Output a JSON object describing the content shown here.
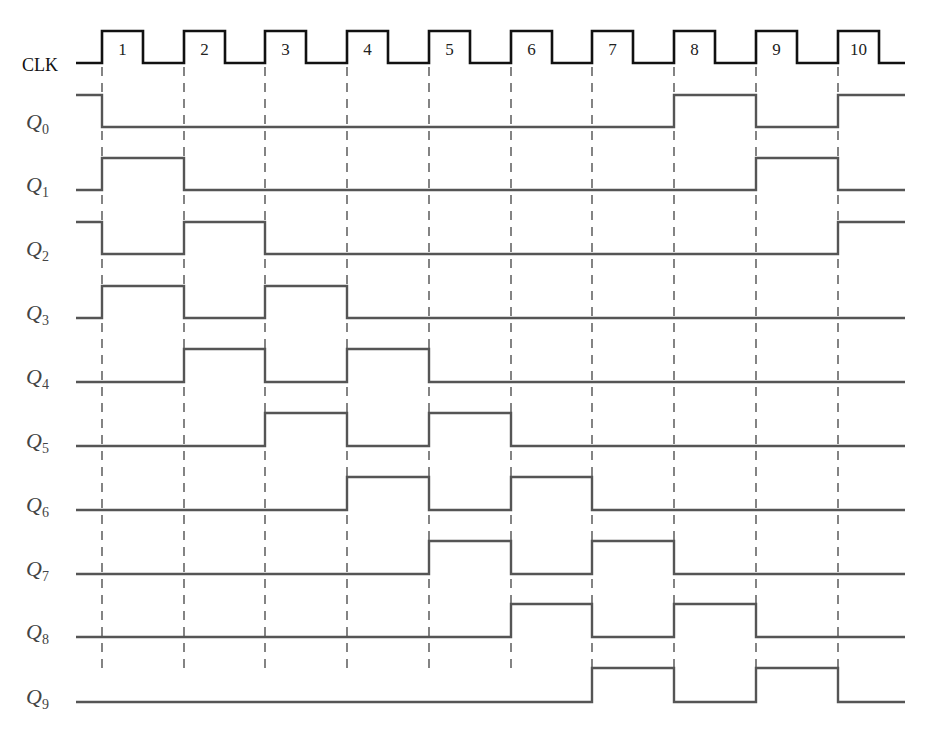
{
  "diagram": {
    "clock": {
      "label": "CLK",
      "pulse_numbers": [
        "1",
        "2",
        "3",
        "4",
        "5",
        "6",
        "7",
        "8",
        "9",
        "10"
      ],
      "edges_x": [
        102,
        184,
        265,
        347,
        429,
        511,
        592,
        674,
        756,
        838
      ],
      "pulse_width": 41,
      "low_y": 63,
      "high_y": 31,
      "start_x": 76,
      "end_x": 905,
      "color": "#111111"
    },
    "signals": [
      {
        "name": "Q",
        "sub": "0",
        "initial": 1,
        "states": [
          0,
          0,
          0,
          0,
          0,
          0,
          0,
          1,
          0,
          1
        ],
        "low_y": 127,
        "high_y": 95
      },
      {
        "name": "Q",
        "sub": "1",
        "initial": 0,
        "states": [
          1,
          0,
          0,
          0,
          0,
          0,
          0,
          0,
          1,
          0
        ],
        "low_y": 190,
        "high_y": 158
      },
      {
        "name": "Q",
        "sub": "2",
        "initial": 1,
        "states": [
          0,
          1,
          0,
          0,
          0,
          0,
          0,
          0,
          0,
          1
        ],
        "low_y": 254,
        "high_y": 222
      },
      {
        "name": "Q",
        "sub": "3",
        "initial": 0,
        "states": [
          1,
          0,
          1,
          0,
          0,
          0,
          0,
          0,
          0,
          0
        ],
        "low_y": 318,
        "high_y": 286
      },
      {
        "name": "Q",
        "sub": "4",
        "initial": 0,
        "states": [
          0,
          1,
          0,
          1,
          0,
          0,
          0,
          0,
          0,
          0
        ],
        "low_y": 382,
        "high_y": 349
      },
      {
        "name": "Q",
        "sub": "5",
        "initial": 0,
        "states": [
          0,
          0,
          1,
          0,
          1,
          0,
          0,
          0,
          0,
          0
        ],
        "low_y": 446,
        "high_y": 413
      },
      {
        "name": "Q",
        "sub": "6",
        "initial": 0,
        "states": [
          0,
          0,
          0,
          1,
          0,
          1,
          0,
          0,
          0,
          0
        ],
        "low_y": 510,
        "high_y": 477
      },
      {
        "name": "Q",
        "sub": "7",
        "initial": 0,
        "states": [
          0,
          0,
          0,
          0,
          1,
          0,
          1,
          0,
          0,
          0
        ],
        "low_y": 574,
        "high_y": 541
      },
      {
        "name": "Q",
        "sub": "8",
        "initial": 0,
        "states": [
          0,
          0,
          0,
          0,
          0,
          1,
          0,
          1,
          0,
          0
        ],
        "low_y": 637,
        "high_y": 604
      },
      {
        "name": "Q",
        "sub": "9",
        "initial": 0,
        "states": [
          0,
          0,
          0,
          0,
          0,
          0,
          1,
          0,
          1,
          0
        ],
        "low_y": 702,
        "high_y": 668
      }
    ],
    "signal_color": "#555555",
    "dash_color": "#333333"
  }
}
